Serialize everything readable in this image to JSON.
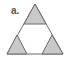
{
  "figure": {
    "label": "a.",
    "colors": {
      "fill": "#c9c9c9",
      "stroke": "#6b6b6b",
      "background": "#ffffff"
    },
    "shapes": {
      "outer": "35,4 7,54 63,54",
      "top": "35,4 24,24 46,24",
      "bottom_left": "17,35 7,54 27,54",
      "bottom_right": "52,35 42,54 63,54"
    }
  }
}
